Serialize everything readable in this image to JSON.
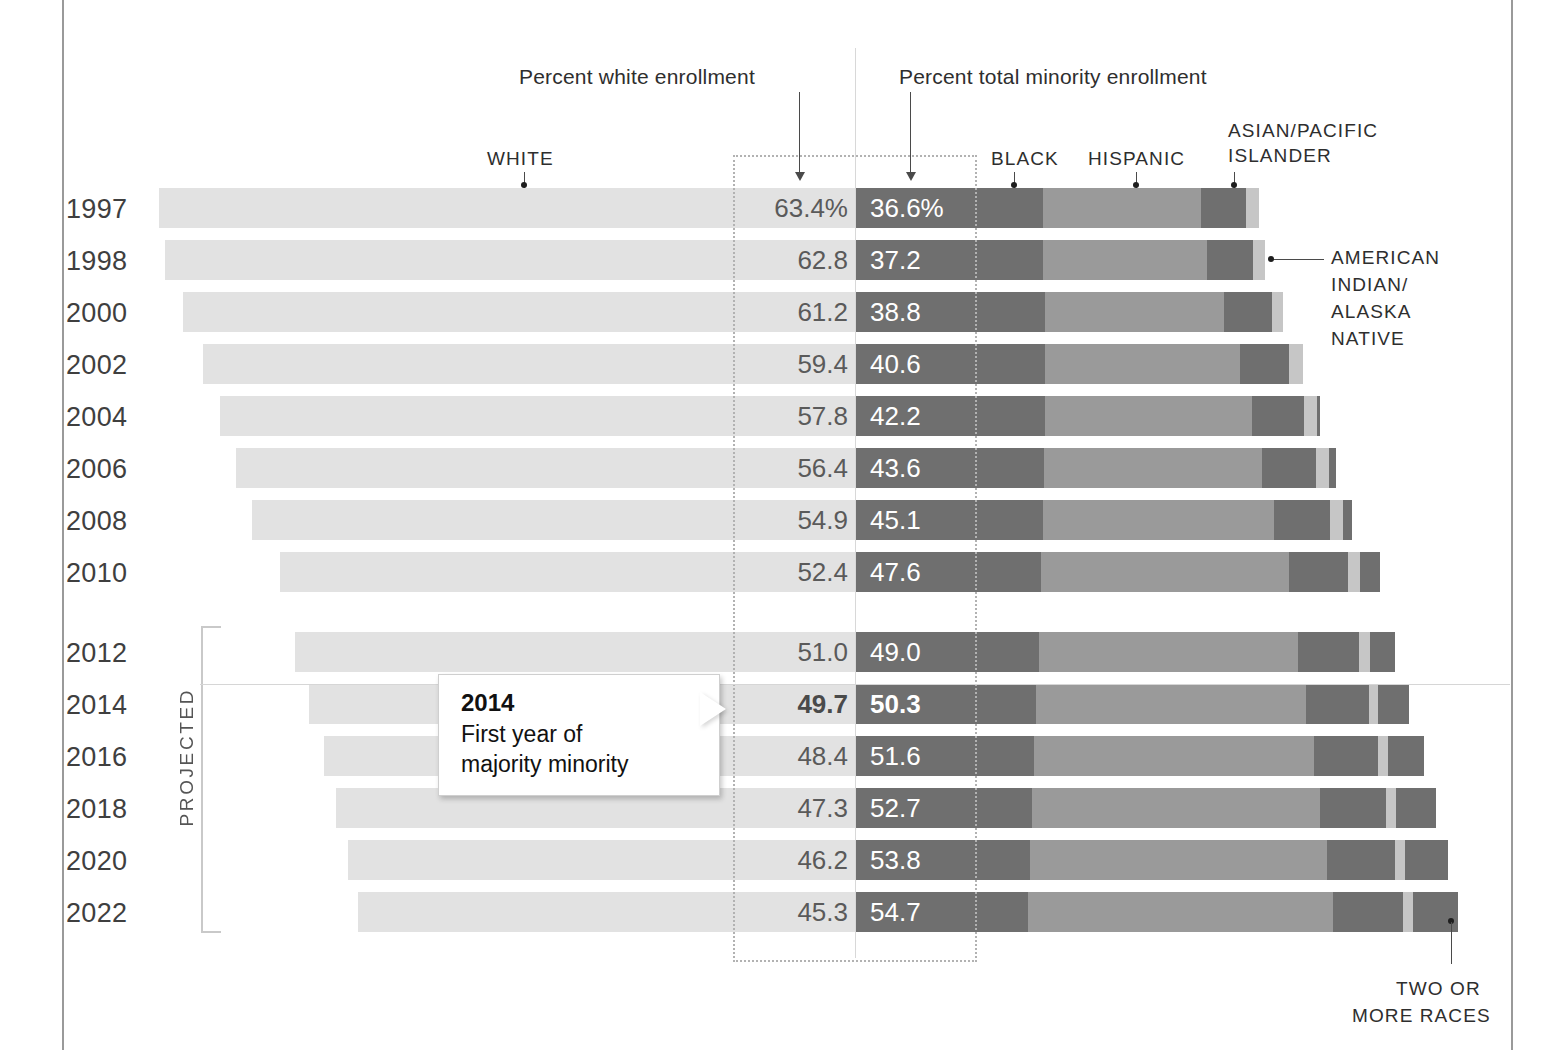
{
  "chart_data": {
    "type": "bar",
    "subtype": "diverging-stacked-bar",
    "title": "",
    "xlabel": "",
    "ylabel": "",
    "grid": false,
    "axis_note_left": "Percent white enrollment",
    "axis_note_right": "Percent total minority enrollment",
    "categories": [
      "1997",
      "1998",
      "2000",
      "2002",
      "2004",
      "2006",
      "2008",
      "2010",
      "2012",
      "2014",
      "2016",
      "2018",
      "2020",
      "2022"
    ],
    "series": [
      {
        "name": "White",
        "values": [
          63.4,
          62.8,
          61.2,
          59.4,
          57.8,
          56.4,
          54.9,
          52.4,
          51.0,
          49.7,
          48.4,
          47.3,
          46.2,
          45.3
        ]
      },
      {
        "name": "Total minority",
        "values": [
          36.6,
          37.2,
          38.8,
          40.6,
          42.2,
          43.6,
          45.1,
          47.6,
          49.0,
          50.3,
          51.6,
          52.7,
          53.8,
          54.7
        ]
      },
      {
        "name": "Black",
        "values": [
          17.0,
          17.0,
          17.2,
          17.2,
          17.2,
          17.1,
          17.0,
          16.8,
          16.6,
          16.4,
          16.2,
          16.0,
          15.8,
          15.6
        ]
      },
      {
        "name": "Hispanic",
        "values": [
          14.4,
          14.9,
          16.3,
          17.7,
          18.8,
          19.8,
          21.0,
          22.6,
          23.6,
          24.5,
          25.4,
          26.2,
          27.0,
          27.8
        ]
      },
      {
        "name": "Asian/Pacific Islander",
        "values": [
          4.1,
          4.2,
          4.3,
          4.5,
          4.7,
          4.9,
          5.1,
          5.3,
          5.5,
          5.7,
          5.9,
          6.0,
          6.2,
          6.3
        ]
      },
      {
        "name": "American Indian/Alaska Native",
        "values": [
          1.1,
          1.1,
          1.0,
          1.2,
          1.2,
          1.2,
          1.2,
          1.1,
          1.0,
          0.9,
          0.9,
          0.9,
          0.9,
          0.9
        ]
      },
      {
        "name": "Two or more races",
        "values": [
          0.0,
          0.0,
          0.0,
          0.0,
          0.3,
          0.6,
          0.8,
          1.8,
          2.3,
          2.8,
          3.2,
          3.6,
          3.9,
          4.1
        ]
      }
    ],
    "white_labels": [
      "63.4%",
      "62.8",
      "61.2",
      "59.4",
      "57.8",
      "56.4",
      "54.9",
      "52.4",
      "51.0",
      "49.7",
      "48.4",
      "47.3",
      "46.2",
      "45.3"
    ],
    "minority_labels": [
      "36.6%",
      "37.2",
      "38.8",
      "40.6",
      "42.2",
      "43.6",
      "45.1",
      "47.6",
      "49.0",
      "50.3",
      "51.6",
      "52.7",
      "53.8",
      "54.7"
    ],
    "highlight_year": "2014",
    "projected_from": "2012",
    "legend_position": "top",
    "colors": {
      "white": "#e2e2e2",
      "black": "#6f6f6f",
      "hispanic": "#9a9a9a",
      "asian": "#6f6f6f",
      "american_indian": "#c6c6c6",
      "two_or_more": "#6f6f6f",
      "text": "#3a3a3a"
    }
  },
  "annotations": {
    "percent_white": "Percent white enrollment",
    "percent_minority": "Percent total minority enrollment",
    "legend_white": "WHITE",
    "legend_black": "BLACK",
    "legend_hispanic": "HISPANIC",
    "legend_asian": "ASIAN/PACIFIC\nISLANDER",
    "legend_asian_line1": "ASIAN/PACIFIC",
    "legend_asian_line2": "ISLANDER",
    "legend_american_indian_line1": "AMERICAN",
    "legend_american_indian_line2": "INDIAN/",
    "legend_american_indian_line3": "ALASKA",
    "legend_american_indian_line4": "NATIVE",
    "legend_two_line1": "TWO OR",
    "legend_two_line2": "MORE RACES",
    "projected": "PROJECTED"
  },
  "callout": {
    "title": "2014",
    "line1": "First year of",
    "line2": "majority minority"
  }
}
